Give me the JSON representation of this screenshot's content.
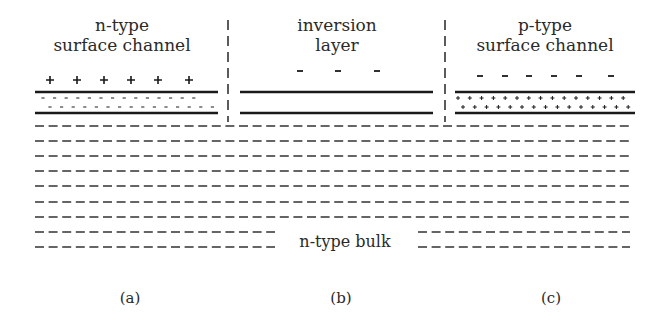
{
  "panels": [
    {
      "id": "a",
      "title_line1": "n-type",
      "title_line2": "surface channel",
      "caption": "(a)",
      "surface_charge": "+",
      "channel_carrier": "-"
    },
    {
      "id": "b",
      "title_line1": "inversion",
      "title_line2": "layer",
      "caption": "(b)",
      "surface_charge": "-"
    },
    {
      "id": "c",
      "title_line1": "p-type",
      "title_line2": "surface channel",
      "caption": "(c)",
      "surface_charge": "-",
      "channel_carrier": "+"
    }
  ],
  "bulk_label": "n-type bulk",
  "colors": {
    "ink": "#1a1a1a",
    "text": "#2a2a2a",
    "background": "#ffffff"
  }
}
